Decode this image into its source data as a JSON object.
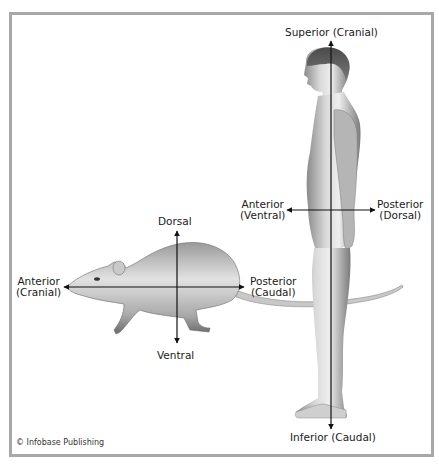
{
  "colors": {
    "frame": "#a8a8a8",
    "axis": "#111111",
    "text": "#1a1a1a",
    "figure_light": "#e6e6e6",
    "figure_dark": "#6f6f6f"
  },
  "rat": {
    "figure_name": "rat",
    "labels": {
      "dorsal": "Dorsal",
      "ventral": "Ventral",
      "anterior_line1": "Anterior",
      "anterior_line2": "(Cranial)",
      "posterior_line1": "Posterior",
      "posterior_line2": "(Caudal)"
    }
  },
  "human": {
    "figure_name": "human",
    "labels": {
      "superior": "Superior (Cranial)",
      "inferior": "Inferior (Caudal)",
      "anterior_line1": "Anterior",
      "anterior_line2": "(Ventral)",
      "posterior_line1": "Posterior",
      "posterior_line2": "(Dorsal)"
    }
  },
  "footer": {
    "copyright": "© Infobase Publishing"
  }
}
